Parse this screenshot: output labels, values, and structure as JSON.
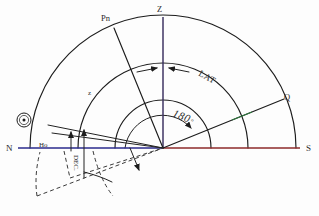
{
  "canvas": {
    "width": 319,
    "height": 216,
    "background": "#fdfdfd"
  },
  "colors": {
    "ink": "#1c1c1c",
    "horizon_left": "#2a2a8c",
    "horizon_right": "#8c2a2a",
    "meridian_vertical": "#4b3a8c",
    "arc_tint_green": "#2f7a3f",
    "dash": "#3a3a3a",
    "label": "#2b2b2b"
  },
  "geometry": {
    "center": {
      "x": 163,
      "y": 148,
      "label": "observer"
    },
    "horizon": {
      "x1": 18,
      "y1": 148,
      "x2": 308,
      "y2": 148
    },
    "outer_radius": 133,
    "mid_radius": 85,
    "inner_radius": 48,
    "angle_arc_radius": 38
  },
  "labels": {
    "zenith": "Z",
    "north_pole": "Pn",
    "equator_point": "Q",
    "north": "N",
    "south": "S",
    "altitude": "Ho",
    "declination": "DEC.",
    "latitude": "LAT",
    "zenith_distance": "z",
    "azimuth": "180",
    "azimuth_degree_symbol": "°",
    "sun_symbol": "☉"
  },
  "annotations": [
    {
      "name": "zenith-label",
      "text": "Z",
      "x": 160,
      "y": 11
    },
    {
      "name": "north-pole-label",
      "text": "Pn",
      "x": 103,
      "y": 19
    },
    {
      "name": "equator-point-label",
      "text": "Q",
      "x": 285,
      "y": 97
    },
    {
      "name": "north-label",
      "text": "N",
      "x": 8,
      "y": 151
    },
    {
      "name": "south-label",
      "text": "S",
      "x": 305,
      "y": 151
    },
    {
      "name": "altitude-label",
      "text": "Ho",
      "x": 40,
      "y": 146
    },
    {
      "name": "declination-label",
      "text": "DEC.",
      "x": 74,
      "y": 152
    },
    {
      "name": "latitude-label",
      "text": "LAT",
      "x": 203,
      "y": 73
    },
    {
      "name": "zenith-distance-label",
      "text": "z",
      "x": 90,
      "y": 93
    },
    {
      "name": "azimuth-label",
      "text": "180",
      "x": 176,
      "y": 114
    },
    {
      "name": "sun-marker",
      "text": "☉",
      "x": 22,
      "y": 122
    }
  ],
  "elements": {
    "outer_arc_name": "celestial-sphere-outer-arc",
    "mid_arc_name": "latitude-arc",
    "inner_arc_name": "zenith-distance-arc",
    "angle_arc_name": "azimuth-angle-arc",
    "pole_line_name": "polar-axis-line",
    "equator_line_name": "celestial-equator-line",
    "zenith_line_name": "zenith-meridian-line",
    "sun_ray_name": "sun-altitude-ray",
    "horizon_line_name": "horizon-line",
    "dashed_lower_name": "below-horizon-dashed-arc"
  }
}
